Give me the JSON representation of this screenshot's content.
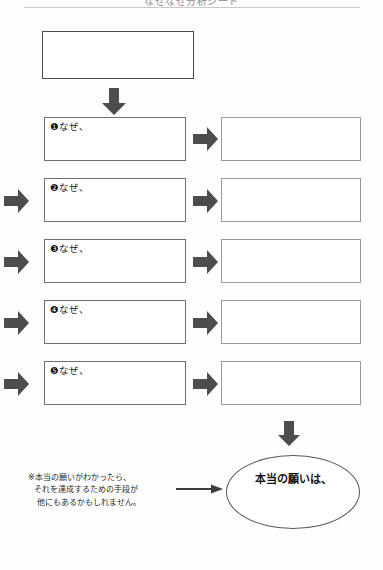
{
  "page": {
    "header_title": "なぜなぜ分析シート",
    "background_color": "#fdfdfd"
  },
  "colors": {
    "arrow_fill": "#4d4d4d",
    "top_box_border": "#4a4a4a",
    "why_box_border": "#6e6e6e",
    "answer_box_border": "#9a9a9a",
    "ellipse_border": "#5a5a5a",
    "rule": "#c9c9c9"
  },
  "top_box": {
    "label": "",
    "placeholder": ""
  },
  "why_rows": [
    {
      "marker": "❶",
      "label": "❶なぜ、",
      "answer": ""
    },
    {
      "marker": "❷",
      "label": "❷なぜ、",
      "answer": ""
    },
    {
      "marker": "❸",
      "label": "❸なぜ、",
      "answer": ""
    },
    {
      "marker": "❹",
      "label": "❹なぜ、",
      "answer": ""
    },
    {
      "marker": "❺",
      "label": "❺なぜ、",
      "answer": ""
    }
  ],
  "conclusion": {
    "label": "本当の願いは、",
    "value": ""
  },
  "note": {
    "line1": "※本当の願いがわかったら、",
    "line2": "それを達成するための手段が",
    "line3": "他にもあるかもしれません。"
  },
  "icons": {
    "down_arrow": "down-arrow-icon",
    "right_arrow": "right-arrow-icon",
    "line_arrow": "line-arrow-icon"
  }
}
